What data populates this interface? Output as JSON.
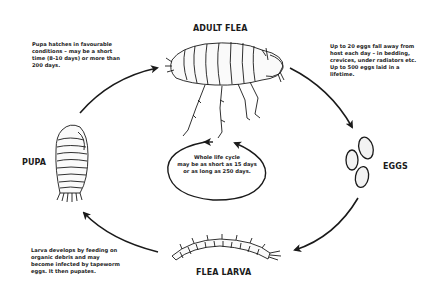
{
  "diagram": {
    "stages": [
      {
        "id": "adult",
        "label": "ADULT FLEA"
      },
      {
        "id": "eggs",
        "label": "EGGS"
      },
      {
        "id": "larva",
        "label": "FLEA LARVA"
      },
      {
        "id": "pupa",
        "label": "PUPA"
      }
    ],
    "notes": {
      "pupa_to_adult": [
        "Pupa hatches in favourable",
        "conditions – may be a short",
        "time (8-10 days) or more than",
        "200 days."
      ],
      "adult_to_eggs": [
        "Up to 20 eggs fall away from",
        "host each day – in bedding,",
        "crevices, under radiators etc.",
        "Up to 500 eggs laid in a",
        "lifetime."
      ],
      "larva_to_pupa": [
        "Larva develops by feeding on",
        "organic debris and may",
        "become infected by tapeworm",
        "eggs. It then pupates."
      ],
      "center": [
        "Whole life cycle",
        "may be as short as 15 days",
        "or as long as 250 days."
      ]
    },
    "arrows": [
      {
        "from": "pupa",
        "to": "adult"
      },
      {
        "from": "adult",
        "to": "eggs"
      },
      {
        "from": "eggs",
        "to": "larva"
      },
      {
        "from": "larva",
        "to": "pupa"
      }
    ],
    "colors": {
      "ink": "#1a1a1a",
      "background": "#ffffff"
    }
  }
}
